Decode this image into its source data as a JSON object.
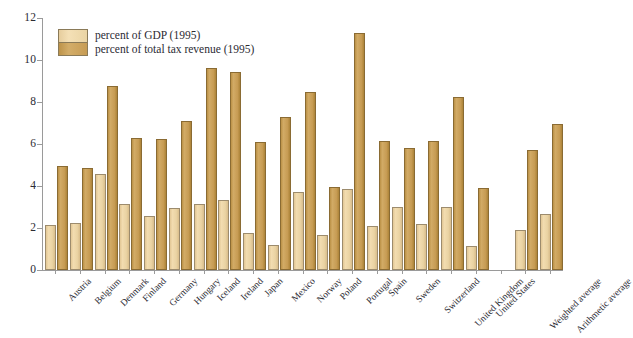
{
  "chart_data": {
    "type": "bar",
    "title": "",
    "subtitle": "",
    "xlabel": "",
    "ylabel": "",
    "ylim": [
      0,
      12
    ],
    "yticks": [
      0,
      2,
      4,
      6,
      8,
      10,
      12
    ],
    "ytick_labels": [
      "0",
      "2",
      "4",
      "6",
      "8",
      "10",
      "12"
    ],
    "grid": false,
    "legend_position": "upper-left-inside",
    "categories": [
      "Austria",
      "Belgium",
      "Denmark",
      "Finland",
      "Germany",
      "Hungary",
      "Iceland",
      "Ireland",
      "Japan",
      "Mexico",
      "Norway",
      "Poland",
      "Portugal",
      "Spain",
      "Sweden",
      "Switzerland",
      "United Kingdom",
      "United States",
      "",
      "Weighted average",
      "Arithmetic average"
    ],
    "series": [
      {
        "name": "percent of GDP (1995)",
        "color": "#ead3a3",
        "values": [
          2.15,
          2.25,
          4.55,
          3.15,
          2.55,
          2.95,
          3.15,
          3.35,
          1.75,
          1.2,
          3.7,
          1.65,
          3.85,
          2.1,
          3.0,
          2.2,
          3.0,
          1.15,
          null,
          1.9,
          2.65
        ]
      },
      {
        "name": "percent of total tax revenue (1995)",
        "color": "#c79c54",
        "values": [
          4.95,
          4.85,
          8.75,
          6.3,
          6.25,
          7.1,
          9.6,
          9.45,
          6.1,
          7.3,
          8.5,
          3.95,
          11.3,
          6.15,
          5.8,
          6.15,
          8.25,
          3.9,
          null,
          5.7,
          6.95
        ]
      }
    ]
  },
  "legend": {
    "items": [
      {
        "label": "percent of GDP (1995)",
        "swatch": "light"
      },
      {
        "label": "percent of total tax revenue (1995)",
        "swatch": "dark"
      }
    ]
  }
}
